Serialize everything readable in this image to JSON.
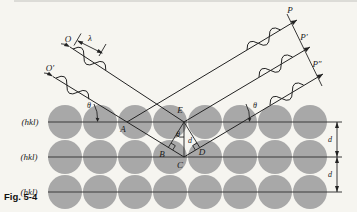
{
  "figure": {
    "caption": "Fig. 5-4",
    "background_color": "#f6f5f0",
    "atom_color": "#a8a8a8",
    "line_color": "#222222"
  },
  "planes": {
    "labels": [
      "(hkl)",
      "(hkl)",
      "(hkl)"
    ],
    "spacing_label_1": "d",
    "spacing_label_2": "d"
  },
  "incident_rays": {
    "ray1_label": "O",
    "ray2_label": "O′",
    "wavelength_label": "λ"
  },
  "diffracted_rays": {
    "ray1_label": "P",
    "ray2_label": "P′",
    "ray3_label": "P″"
  },
  "angles": {
    "theta_left": "θ",
    "theta_right": "θ",
    "theta_at_E": "θ"
  },
  "points": {
    "E": "E",
    "A": "A",
    "B": "B",
    "C": "C",
    "D": "D",
    "d_between_E_C": "d"
  }
}
